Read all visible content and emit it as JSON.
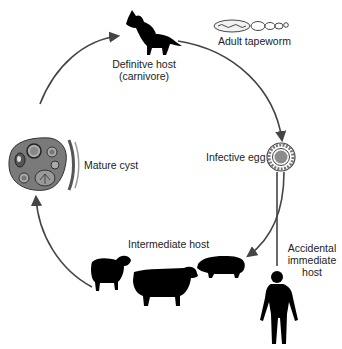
{
  "diagram": {
    "type": "life-cycle",
    "colors": {
      "arrow": "#444444",
      "silhouette": "#000000",
      "cyst_fill": "#7a7a7a",
      "egg_fill": "#8c8c8c",
      "text": "#222222"
    },
    "nodes": {
      "definitive_host": {
        "label_line1": "Definitve host",
        "label_line2": "(carnivore)",
        "icon": "dog-silhouette-icon"
      },
      "adult_tapeworm": {
        "label": "Adult tapeworm",
        "icon": "tapeworm-icon"
      },
      "infective_egg": {
        "label": "Infective egg",
        "icon": "egg-icon"
      },
      "accidental_host": {
        "label_line1": "Accidental",
        "label_line2": "immediate",
        "label_line3": "host",
        "icon": "human-silhouette-icon"
      },
      "intermediate_host": {
        "label": "Intermediate host",
        "icons": [
          "sheep-silhouette-icon",
          "cow-silhouette-icon",
          "pig-silhouette-icon"
        ]
      },
      "mature_cyst": {
        "label": "Mature cyst",
        "icon": "cyst-icon"
      }
    },
    "edges": [
      {
        "from": "mature_cyst",
        "to": "definitive_host"
      },
      {
        "from": "definitive_host",
        "to": "infective_egg"
      },
      {
        "from": "infective_egg",
        "to": "intermediate_host"
      },
      {
        "from": "infective_egg",
        "to": "accidental_host"
      },
      {
        "from": "intermediate_host",
        "to": "mature_cyst"
      }
    ]
  }
}
